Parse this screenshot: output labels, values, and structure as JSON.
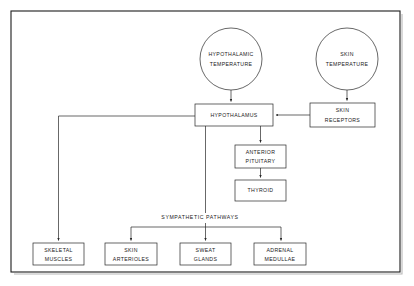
{
  "diagram": {
    "page_width": 414,
    "page_height": 286,
    "background_color": "#ffffff",
    "line_color": "#262626",
    "text_color": "#1a1a1a",
    "frame": {
      "x": 11,
      "y": 11,
      "width": 389,
      "height": 261,
      "shadow_color": "#b8b8b8"
    },
    "nodes": {
      "hypothalamic_temperature": {
        "shape": "circle",
        "line1": "HYPOTHALAMIC",
        "line2": "TEMPERATURE",
        "cx": 231,
        "cy": 59,
        "r": 31
      },
      "skin_temperature": {
        "shape": "circle",
        "line1": "SKIN",
        "line2": "TEMPERATURE",
        "cx": 347,
        "cy": 59,
        "r": 31
      },
      "hypothalamus": {
        "shape": "box",
        "line1": "HYPOTHALAMUS",
        "line2": "",
        "x": 195,
        "y": 104,
        "width": 78,
        "height": 22
      },
      "skin_receptors": {
        "shape": "box",
        "line1": "SKIN",
        "line2": "RECEPTORS",
        "x": 310,
        "y": 103,
        "width": 65,
        "height": 24
      },
      "anterior_pituitary": {
        "shape": "box",
        "line1": "ANTERIOR",
        "line2": "PITUITARY",
        "x": 235,
        "y": 145,
        "width": 51,
        "height": 23
      },
      "thyroid": {
        "shape": "box",
        "line1": "THYROID",
        "line2": "",
        "x": 235,
        "y": 180,
        "width": 51,
        "height": 21
      },
      "skeletal_muscles": {
        "shape": "box",
        "line1": "SKELETAL",
        "line2": "MUSCLES",
        "x": 33,
        "y": 243,
        "width": 51,
        "height": 22
      },
      "skin_arterioles": {
        "shape": "box",
        "line1": "SKIN",
        "line2": "ARTERIOLES",
        "x": 105,
        "y": 243,
        "width": 52,
        "height": 22
      },
      "sweat_glands": {
        "shape": "box",
        "line1": "SWEAT",
        "line2": "GLANDS",
        "x": 180,
        "y": 243,
        "width": 51,
        "height": 22
      },
      "adrenal_medullae": {
        "shape": "box",
        "line1": "ADRENAL",
        "line2": "MEDULLAE",
        "x": 254,
        "y": 243,
        "width": 52,
        "height": 22
      }
    },
    "edge_labels": {
      "sympathetic_pathways": {
        "text": "SYMPATHETIC  PATHWAYS",
        "x": 200,
        "y": 218
      }
    },
    "edges": [
      {
        "name": "hypothalamic-temperature-to-hypothalamus",
        "from": "hypothalamic_temperature",
        "to": "hypothalamus",
        "arrow": true
      },
      {
        "name": "skin-temperature-to-skin-receptors",
        "from": "skin_temperature",
        "to": "skin_receptors",
        "arrow": true
      },
      {
        "name": "skin-receptors-to-hypothalamus",
        "from": "skin_receptors",
        "to": "hypothalamus",
        "arrow": true
      },
      {
        "name": "hypothalamus-to-anterior-pituitary",
        "from": "hypothalamus",
        "to": "anterior_pituitary",
        "arrow": true
      },
      {
        "name": "anterior-pituitary-to-thyroid",
        "from": "anterior_pituitary",
        "to": "thyroid",
        "arrow": true
      },
      {
        "name": "hypothalamus-to-skeletal-muscles",
        "from": "hypothalamus",
        "to": "skeletal_muscles",
        "arrow": true
      },
      {
        "name": "hypothalamus-to-sympathetic-bus",
        "from": "hypothalamus",
        "to": "sympathetic_bus",
        "arrow": false
      },
      {
        "name": "sympathetic-bus-to-skin-arterioles",
        "from": "sympathetic_bus",
        "to": "skin_arterioles",
        "arrow": true
      },
      {
        "name": "sympathetic-bus-to-sweat-glands",
        "from": "sympathetic_bus",
        "to": "sweat_glands",
        "arrow": true
      },
      {
        "name": "sympathetic-bus-to-adrenal-medullae",
        "from": "sympathetic_bus",
        "to": "adrenal_medullae",
        "arrow": true
      }
    ]
  }
}
